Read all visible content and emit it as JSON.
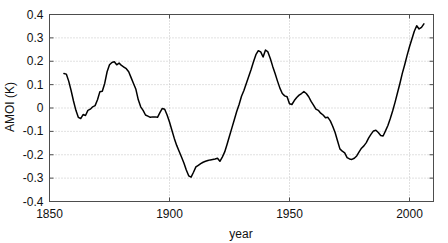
{
  "chart_data": {
    "type": "line",
    "title": "",
    "xlabel": "year",
    "ylabel": "AMOI (K)",
    "xlim": [
      1850,
      2010
    ],
    "ylim": [
      -0.4,
      0.4
    ],
    "xticks": [
      1850,
      1900,
      1950,
      2000
    ],
    "xtick_labels": [
      "1850",
      "1900",
      "1950",
      "2000"
    ],
    "yticks": [
      -0.4,
      -0.3,
      -0.2,
      -0.1,
      0,
      0.1,
      0.2,
      0.3,
      0.4
    ],
    "ytick_labels": [
      "-0.4",
      "-0.3",
      "-0.2",
      "-0.1",
      "0",
      "0.1",
      "0.2",
      "0.3",
      "0.4"
    ],
    "grid": true,
    "legend": null,
    "line_color": "#000000",
    "series": [
      {
        "name": "AMOI",
        "x": [
          1856,
          1857,
          1858,
          1859,
          1860,
          1861,
          1862,
          1863,
          1864,
          1865,
          1866,
          1867,
          1868,
          1869,
          1870,
          1871,
          1872,
          1873,
          1874,
          1875,
          1876,
          1877,
          1878,
          1879,
          1880,
          1881,
          1882,
          1883,
          1884,
          1885,
          1886,
          1887,
          1888,
          1889,
          1890,
          1891,
          1892,
          1893,
          1894,
          1895,
          1896,
          1897,
          1898,
          1899,
          1900,
          1901,
          1902,
          1903,
          1904,
          1905,
          1906,
          1907,
          1908,
          1909,
          1910,
          1911,
          1912,
          1913,
          1914,
          1915,
          1916,
          1917,
          1918,
          1919,
          1920,
          1921,
          1922,
          1923,
          1924,
          1925,
          1926,
          1927,
          1928,
          1929,
          1930,
          1931,
          1932,
          1933,
          1934,
          1935,
          1936,
          1937,
          1938,
          1939,
          1940,
          1941,
          1942,
          1943,
          1944,
          1945,
          1946,
          1947,
          1948,
          1949,
          1950,
          1951,
          1952,
          1953,
          1954,
          1955,
          1956,
          1957,
          1958,
          1959,
          1960,
          1961,
          1962,
          1963,
          1964,
          1965,
          1966,
          1967,
          1968,
          1969,
          1970,
          1971,
          1972,
          1973,
          1974,
          1975,
          1976,
          1977,
          1978,
          1979,
          1980,
          1981,
          1982,
          1983,
          1984,
          1985,
          1986,
          1987,
          1988,
          1989,
          1990,
          1991,
          1992,
          1993,
          1994,
          1995,
          1996,
          1997,
          1998,
          1999,
          2000,
          2001,
          2002,
          2003,
          2004,
          2005,
          2006
        ],
        "values": [
          0.148,
          0.145,
          0.115,
          0.075,
          0.03,
          -0.01,
          -0.04,
          -0.045,
          -0.028,
          -0.032,
          -0.01,
          -0.005,
          0.005,
          0.01,
          0.035,
          0.07,
          0.072,
          0.105,
          0.155,
          0.185,
          0.195,
          0.198,
          0.185,
          0.192,
          0.182,
          0.175,
          0.168,
          0.155,
          0.13,
          0.105,
          0.08,
          0.035,
          0.005,
          -0.01,
          -0.03,
          -0.035,
          -0.04,
          -0.038,
          -0.038,
          -0.04,
          -0.02,
          -0.002,
          -0.005,
          -0.03,
          -0.06,
          -0.095,
          -0.13,
          -0.16,
          -0.185,
          -0.21,
          -0.235,
          -0.265,
          -0.29,
          -0.296,
          -0.275,
          -0.252,
          -0.245,
          -0.238,
          -0.232,
          -0.228,
          -0.225,
          -0.222,
          -0.22,
          -0.218,
          -0.215,
          -0.228,
          -0.21,
          -0.188,
          -0.155,
          -0.12,
          -0.085,
          -0.05,
          -0.015,
          0.015,
          0.05,
          0.075,
          0.105,
          0.135,
          0.165,
          0.198,
          0.228,
          0.245,
          0.24,
          0.218,
          0.248,
          0.24,
          0.212,
          0.178,
          0.148,
          0.115,
          0.085,
          0.062,
          0.052,
          0.048,
          0.018,
          0.015,
          0.032,
          0.045,
          0.055,
          0.062,
          0.07,
          0.062,
          0.048,
          0.028,
          0.012,
          -0.005,
          -0.01,
          -0.022,
          -0.03,
          -0.042,
          -0.04,
          -0.055,
          -0.078,
          -0.105,
          -0.14,
          -0.175,
          -0.185,
          -0.192,
          -0.212,
          -0.218,
          -0.22,
          -0.215,
          -0.205,
          -0.188,
          -0.172,
          -0.162,
          -0.148,
          -0.128,
          -0.112,
          -0.098,
          -0.095,
          -0.105,
          -0.118,
          -0.12,
          -0.098,
          -0.075,
          -0.045,
          -0.012,
          0.025,
          0.065,
          0.105,
          0.148,
          0.185,
          0.225,
          0.262,
          0.295,
          0.328,
          0.352,
          0.338,
          0.345,
          0.36
        ]
      }
    ]
  },
  "axis_labels": {
    "x_title": "year",
    "y_title": "AMOI (K)"
  }
}
